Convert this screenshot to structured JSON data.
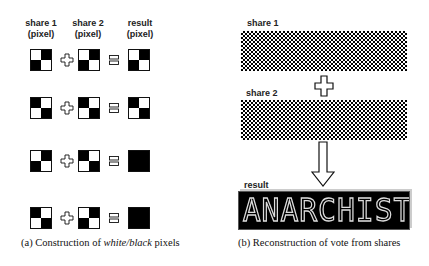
{
  "panel_a": {
    "headers": {
      "share1": [
        "share 1",
        "(pixel)"
      ],
      "share2": [
        "share 2",
        "(pixel)"
      ],
      "result": [
        "result",
        "(pixel)"
      ]
    },
    "rows": [
      {
        "share1": [
          "w",
          "b",
          "b",
          "w"
        ],
        "share2": [
          "w",
          "b",
          "b",
          "w"
        ],
        "result": [
          "w",
          "b",
          "b",
          "w"
        ]
      },
      {
        "share1": [
          "b",
          "w",
          "w",
          "b"
        ],
        "share2": [
          "b",
          "w",
          "w",
          "b"
        ],
        "result": [
          "b",
          "w",
          "w",
          "b"
        ]
      },
      {
        "share1": [
          "w",
          "b",
          "b",
          "w"
        ],
        "share2": [
          "b",
          "w",
          "w",
          "b"
        ],
        "result": [
          "b",
          "b",
          "b",
          "b"
        ]
      },
      {
        "share1": [
          "b",
          "w",
          "w",
          "b"
        ],
        "share2": [
          "w",
          "b",
          "b",
          "w"
        ],
        "result": [
          "b",
          "b",
          "b",
          "b"
        ]
      }
    ],
    "operators": {
      "plus": "plus-icon",
      "equals": "equals-icon"
    },
    "caption_prefix": "(a)  Construction of ",
    "caption_italic": "white/black",
    "caption_suffix": " pixels"
  },
  "panel_b": {
    "share1_label": "share 1",
    "share2_label": "share 2",
    "result_label": "result",
    "result_text": "ANARCHIST",
    "operators": {
      "plus": "plus-icon",
      "arrow": "arrow-down-icon"
    },
    "caption": "(b)  Reconstruction of vote from shares"
  }
}
